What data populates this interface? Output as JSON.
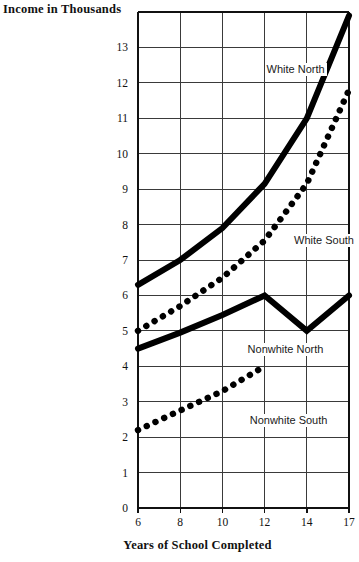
{
  "chart_data": {
    "type": "line",
    "title": "",
    "ylabel": "Income in Thousands",
    "xlabel": "Years of School Completed",
    "x_tick_labels": [
      "6",
      "8",
      "10",
      "12",
      "14",
      "17"
    ],
    "x_tick_values": [
      6,
      8,
      10,
      12,
      14,
      17
    ],
    "y_tick_labels": [
      "0",
      "1",
      "2",
      "3",
      "4",
      "5",
      "6",
      "7",
      "8",
      "9",
      "10",
      "11",
      "12",
      "13"
    ],
    "y_tick_values": [
      0,
      1,
      2,
      3,
      4,
      5,
      6,
      7,
      8,
      9,
      10,
      11,
      12,
      13
    ],
    "ylim": [
      0,
      14
    ],
    "grid": "both",
    "legend_position": "inline-annotations",
    "series": [
      {
        "name": "White North",
        "style": "solid",
        "label_x": 12,
        "label_y": 12.35,
        "x": [
          6,
          8,
          10,
          12,
          14,
          17
        ],
        "values": [
          6.3,
          7.0,
          7.9,
          9.15,
          11.0,
          13.9
        ]
      },
      {
        "name": "White South",
        "style": "dotted",
        "label_x": 13.3,
        "label_y": 7.55,
        "x": [
          6,
          8,
          10,
          12,
          14,
          17
        ],
        "values": [
          5.0,
          5.7,
          6.5,
          7.55,
          9.15,
          11.8
        ]
      },
      {
        "name": "Nonwhite North",
        "style": "solid",
        "label_x": 11.1,
        "label_y": 4.45,
        "x": [
          6,
          8,
          10,
          12,
          14,
          17
        ],
        "values": [
          4.5,
          4.95,
          5.45,
          6.0,
          5.0,
          6.0
        ]
      },
      {
        "name": "Nonwhite South",
        "style": "dotted",
        "label_x": 11.2,
        "label_y": 2.45,
        "x": [
          6,
          8,
          10,
          12
        ],
        "values": [
          2.2,
          2.75,
          3.3,
          4.0
        ]
      }
    ],
    "colors": {
      "series_line": "#000000",
      "grid_line": "#3a3a3a",
      "axis_line": "#111111",
      "background": "#ffffff",
      "text": "#111111"
    }
  }
}
